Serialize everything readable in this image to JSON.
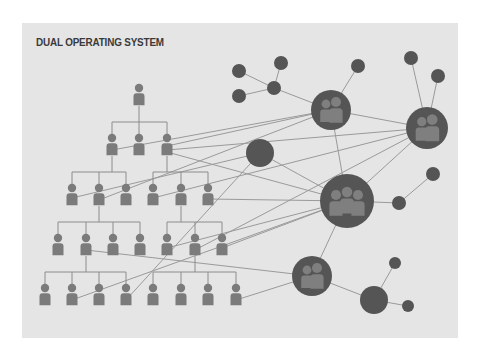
{
  "diagram": {
    "title": "DUAL OPERATING SYSTEM",
    "colors": {
      "background": "#ffffff",
      "panel": "#e5e5e5",
      "title": "#3a3a3a",
      "person": "#7b7b7b",
      "node": "#555555",
      "group_figure": "#7f7f7f",
      "edge": "#9a9a9a"
    },
    "hierarchy": {
      "levels": [
        {
          "y": 88,
          "x": [
            139
          ]
        },
        {
          "y": 138,
          "x": [
            112,
            139,
            167
          ]
        },
        {
          "y": 188,
          "x": [
            72,
            99,
            126,
            153,
            181,
            208
          ]
        },
        {
          "y": 238,
          "x": [
            58,
            86,
            113,
            140,
            167,
            195,
            222
          ]
        },
        {
          "y": 288,
          "x": [
            45,
            72,
            99,
            126,
            153,
            181,
            208,
            236
          ]
        }
      ],
      "branches": [
        {
          "parent": [
            139,
            106
          ],
          "bar_y": 122,
          "children": [
            112,
            139,
            167
          ],
          "child_top": 134
        },
        {
          "parent": [
            112,
            156
          ],
          "bar_y": 172,
          "children": [
            72,
            99,
            126
          ],
          "child_top": 184
        },
        {
          "parent": [
            167,
            156
          ],
          "bar_y": 172,
          "children": [
            153,
            181,
            208
          ],
          "child_top": 184
        },
        {
          "parent": [
            99,
            206
          ],
          "bar_y": 222,
          "children": [
            58,
            86,
            113,
            140
          ],
          "child_top": 234
        },
        {
          "parent": [
            181,
            206
          ],
          "bar_y": 222,
          "children": [
            167,
            195,
            222
          ],
          "child_top": 234
        },
        {
          "parent": [
            86,
            256
          ],
          "bar_y": 272,
          "children": [
            45,
            72,
            99,
            126
          ],
          "child_top": 284
        },
        {
          "parent": [
            195,
            256
          ],
          "bar_y": 272,
          "children": [
            153,
            181,
            208,
            236
          ],
          "child_top": 284
        }
      ]
    },
    "network": {
      "group_nodes": [
        {
          "id": "A",
          "cx": 331,
          "cy": 110,
          "r": 20,
          "people": 2
        },
        {
          "id": "B",
          "cx": 427,
          "cy": 128,
          "r": 21,
          "people": 2
        },
        {
          "id": "C",
          "cx": 347,
          "cy": 201,
          "r": 27,
          "people": 3
        },
        {
          "id": "D",
          "cx": 312,
          "cy": 276,
          "r": 20,
          "people": 2
        }
      ],
      "solid_nodes": [
        {
          "id": "S1",
          "cx": 260,
          "cy": 153,
          "r": 14
        },
        {
          "id": "S2",
          "cx": 374,
          "cy": 300,
          "r": 14
        },
        {
          "id": "n1",
          "cx": 239,
          "cy": 71,
          "r": 7
        },
        {
          "id": "n2",
          "cx": 281,
          "cy": 63,
          "r": 7
        },
        {
          "id": "n3",
          "cx": 239,
          "cy": 96,
          "r": 7
        },
        {
          "id": "n4",
          "cx": 274,
          "cy": 88,
          "r": 7
        },
        {
          "id": "n5",
          "cx": 358,
          "cy": 66,
          "r": 7
        },
        {
          "id": "n6",
          "cx": 411,
          "cy": 58,
          "r": 7
        },
        {
          "id": "n7",
          "cx": 438,
          "cy": 76,
          "r": 7
        },
        {
          "id": "n8",
          "cx": 399,
          "cy": 203,
          "r": 7
        },
        {
          "id": "n9",
          "cx": 433,
          "cy": 174,
          "r": 7
        },
        {
          "id": "n10",
          "cx": 395,
          "cy": 263,
          "r": 6
        },
        {
          "id": "n11",
          "cx": 408,
          "cy": 306,
          "r": 6
        }
      ],
      "edges": [
        [
          [
            239,
            71
          ],
          [
            274,
            88
          ]
        ],
        [
          [
            239,
            96
          ],
          [
            274,
            88
          ]
        ],
        [
          [
            281,
            63
          ],
          [
            274,
            88
          ]
        ],
        [
          [
            274,
            88
          ],
          [
            331,
            110
          ]
        ],
        [
          [
            358,
            66
          ],
          [
            331,
            110
          ]
        ],
        [
          [
            411,
            58
          ],
          [
            427,
            128
          ]
        ],
        [
          [
            438,
            76
          ],
          [
            427,
            128
          ]
        ],
        [
          [
            331,
            110
          ],
          [
            347,
            201
          ]
        ],
        [
          [
            331,
            110
          ],
          [
            427,
            128
          ]
        ],
        [
          [
            427,
            128
          ],
          [
            347,
            201
          ]
        ],
        [
          [
            347,
            201
          ],
          [
            399,
            203
          ]
        ],
        [
          [
            399,
            203
          ],
          [
            433,
            174
          ]
        ],
        [
          [
            347,
            201
          ],
          [
            312,
            276
          ]
        ],
        [
          [
            312,
            276
          ],
          [
            374,
            300
          ]
        ],
        [
          [
            374,
            300
          ],
          [
            395,
            263
          ]
        ],
        [
          [
            374,
            300
          ],
          [
            408,
            306
          ]
        ],
        [
          [
            260,
            153
          ],
          [
            347,
            201
          ]
        ],
        [
          [
            112,
            150
          ],
          [
            331,
            110
          ]
        ],
        [
          [
            167,
            146
          ],
          [
            331,
            110
          ]
        ],
        [
          [
            167,
            150
          ],
          [
            427,
            128
          ]
        ],
        [
          [
            167,
            152
          ],
          [
            347,
            201
          ]
        ],
        [
          [
            72,
            198
          ],
          [
            260,
            153
          ]
        ],
        [
          [
            153,
            198
          ],
          [
            427,
            128
          ]
        ],
        [
          [
            208,
            199
          ],
          [
            347,
            201
          ]
        ],
        [
          [
            99,
            200
          ],
          [
            331,
            110
          ]
        ],
        [
          [
            167,
            248
          ],
          [
            347,
            201
          ]
        ],
        [
          [
            195,
            250
          ],
          [
            427,
            128
          ]
        ],
        [
          [
            222,
            248
          ],
          [
            347,
            201
          ]
        ],
        [
          [
            86,
            250
          ],
          [
            312,
            276
          ]
        ],
        [
          [
            72,
            300
          ],
          [
            347,
            201
          ]
        ],
        [
          [
            236,
            300
          ],
          [
            312,
            276
          ]
        ],
        [
          [
            126,
            300
          ],
          [
            260,
            153
          ]
        ]
      ]
    }
  }
}
